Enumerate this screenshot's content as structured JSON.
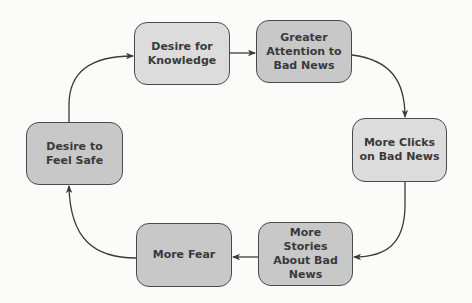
{
  "diagram": {
    "type": "cycle",
    "nodes": [
      {
        "id": "knowledge",
        "label": "Desire for\nKnowledge",
        "shade": "#dcdcdc"
      },
      {
        "id": "attention",
        "label": "Greater\nAttention to\nBad News",
        "shade": "#c8c8c8"
      },
      {
        "id": "clicks",
        "label": "More Clicks\non Bad News",
        "shade": "#dcdcdc"
      },
      {
        "id": "stories",
        "label": "More\nStories\nAbout Bad\nNews",
        "shade": "#c8c8c8"
      },
      {
        "id": "fear",
        "label": "More Fear",
        "shade": "#c8c8c8"
      },
      {
        "id": "safe",
        "label": "Desire to\nFeel Safe",
        "shade": "#c8c8c8"
      }
    ],
    "edges": [
      {
        "from": "knowledge",
        "to": "attention"
      },
      {
        "from": "attention",
        "to": "clicks"
      },
      {
        "from": "clicks",
        "to": "stories"
      },
      {
        "from": "stories",
        "to": "fear"
      },
      {
        "from": "fear",
        "to": "safe"
      },
      {
        "from": "safe",
        "to": "knowledge"
      }
    ],
    "colors": {
      "background": "#fbfbfa",
      "border": "#4a4a4a",
      "text": "#3a3a3a",
      "arrow": "#3a3a3a"
    }
  }
}
